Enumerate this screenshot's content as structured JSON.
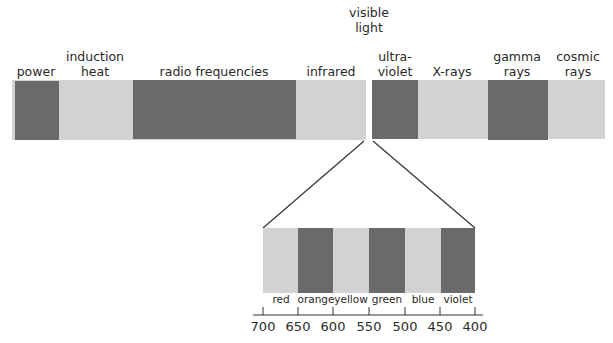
{
  "colors": {
    "dark": "#6a6a6a",
    "light": "#d2d2d2",
    "line": "#333333",
    "text": "#2a2a2a"
  },
  "spectrum": {
    "title": "visible\nlight",
    "bands": [
      {
        "label": "power",
        "shade": "dark"
      },
      {
        "label": "induction\nheat",
        "shade": "light"
      },
      {
        "label": "radio frequencies",
        "shade": "dark"
      },
      {
        "label": "infrared",
        "shade": "light"
      },
      {
        "label": "ultra-\nviolet",
        "shade": "dark"
      },
      {
        "label": "X-rays",
        "shade": "light"
      },
      {
        "label": "gamma\nrays",
        "shade": "dark"
      },
      {
        "label": "cosmic\nrays",
        "shade": "light"
      }
    ]
  },
  "visible": {
    "bands": [
      {
        "label": "red",
        "shade": "light"
      },
      {
        "label": "orange",
        "shade": "dark"
      },
      {
        "label": "yellow",
        "shade": "light"
      },
      {
        "label": "green",
        "shade": "dark"
      },
      {
        "label": "blue",
        "shade": "light"
      },
      {
        "label": "violet",
        "shade": "dark"
      }
    ],
    "axis_ticks": [
      "700",
      "650",
      "600",
      "550",
      "500",
      "450",
      "400"
    ]
  }
}
